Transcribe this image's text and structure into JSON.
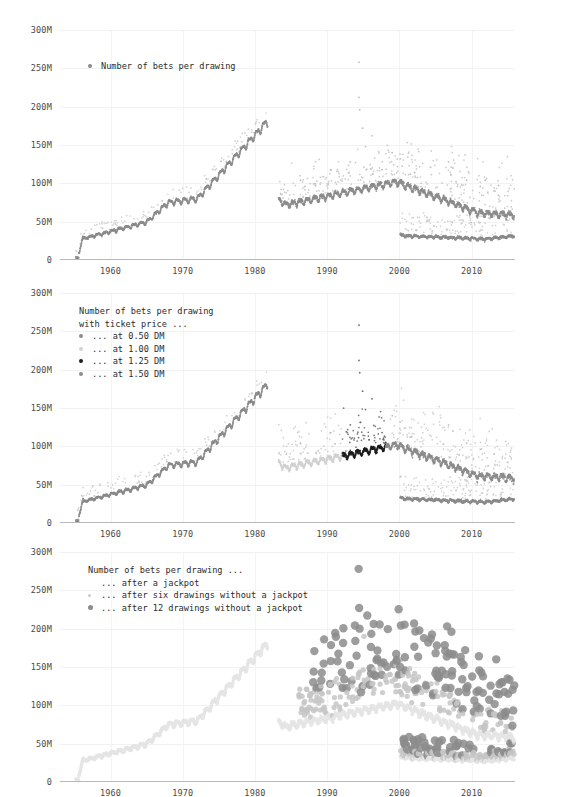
{
  "figure": {
    "background": "#ffffff",
    "gridline_color": "#f2f2f2",
    "axis_color": "#b9b9b9",
    "text_color": "#3a3a3a"
  },
  "colors": {
    "mid_gray": "#8c8c8c",
    "light_gray": "#c9c9c9",
    "very_light_gray": "#e2e2e2",
    "dark": "#222222",
    "outlier_gray": "#bdbdbd"
  },
  "charts": [
    {
      "id": "chart-total-bets",
      "type": "scatter",
      "title": "",
      "xlabel": "",
      "ylabel": "",
      "xlim": [
        1953,
        2016
      ],
      "ylim": [
        0,
        300
      ],
      "grid": true,
      "legend_position": "top-left",
      "ytick_labels": [
        "300M",
        "250M",
        "200M",
        "150M",
        "100M",
        "50M",
        "0"
      ],
      "ytick_values": [
        300,
        250,
        200,
        150,
        100,
        50,
        0
      ],
      "xtick_labels": [
        "1960",
        "1970",
        "1980",
        "1990",
        "2000",
        "2010"
      ],
      "xtick_values": [
        1960,
        1970,
        1980,
        1990,
        2000,
        2010
      ],
      "legend": [
        {
          "label": "Number of bets per drawing",
          "color": "#8c8c8c",
          "marker": "circle"
        }
      ],
      "series": [
        {
          "name": "Number of bets per drawing",
          "color": "#8c8c8c",
          "note": "weekly draws 1955-2015; rises to 180M by 1981, gap 1982-83, plateau ~100M 1985-2000, decline to ~60M by 2015; second lower branch ~30M from 2000 (midweek draw)"
        }
      ]
    },
    {
      "id": "chart-ticket-price",
      "type": "scatter",
      "title": "",
      "xlabel": "",
      "ylabel": "",
      "xlim": [
        1953,
        2016
      ],
      "ylim": [
        0,
        300
      ],
      "grid": true,
      "legend_position": "top-left",
      "ytick_labels": [
        "300M",
        "250M",
        "200M",
        "150M",
        "100M",
        "50M",
        "0"
      ],
      "ytick_values": [
        300,
        250,
        200,
        150,
        100,
        50,
        0
      ],
      "xtick_labels": [
        "1960",
        "1970",
        "1980",
        "1990",
        "2000",
        "2010"
      ],
      "xtick_values": [
        1960,
        1970,
        1980,
        1990,
        2000,
        2010
      ],
      "legend_title_lines": [
        "Number of bets per drawing",
        "with ticket price ..."
      ],
      "legend": [
        {
          "label": "... at 0.50 DM",
          "color": "#8c8c8c",
          "marker": "circle"
        },
        {
          "label": "... at 1.00 DM",
          "color": "#d2d2d2",
          "marker": "circle"
        },
        {
          "label": "... at 1.25 DM",
          "color": "#1d1d1d",
          "marker": "circle"
        },
        {
          "label": "... at 1.50 DM",
          "color": "#8c8c8c",
          "marker": "circle"
        }
      ],
      "series": [
        {
          "name": "... at 0.50 DM",
          "color": "#8c8c8c",
          "span": [
            1955,
            1981
          ]
        },
        {
          "name": "... at 1.00 DM",
          "color": "#d2d2d2",
          "span": [
            1983,
            1992
          ]
        },
        {
          "name": "... at 1.25 DM",
          "color": "#1d1d1d",
          "span": [
            1992,
            1998
          ]
        },
        {
          "name": "... at 1.50 DM",
          "color": "#8c8c8c",
          "span": [
            1998,
            2015
          ]
        }
      ]
    },
    {
      "id": "chart-jackpot-rollover",
      "type": "scatter",
      "title": "",
      "xlabel": "",
      "ylabel": "",
      "xlim": [
        1953,
        2016
      ],
      "ylim": [
        0,
        300
      ],
      "grid": true,
      "legend_position": "top-left",
      "ytick_labels": [
        "300M",
        "250M",
        "200M",
        "150M",
        "100M",
        "50M",
        "0"
      ],
      "ytick_values": [
        300,
        250,
        200,
        150,
        100,
        50,
        0
      ],
      "xtick_labels": [
        "1960",
        "1970",
        "1980",
        "1990",
        "2000",
        "2010"
      ],
      "xtick_values": [
        1960,
        1970,
        1980,
        1990,
        2000,
        2010
      ],
      "legend_title_lines": [
        "Number of bets per drawing ..."
      ],
      "legend": [
        {
          "label": "... after a jackpot",
          "color": "#e8e8e8",
          "marker": "none",
          "size": 0
        },
        {
          "label": "... after six drawings without a jackpot",
          "color": "#c9c9c9",
          "marker": "circle",
          "size": 3
        },
        {
          "label": "... after 12 drawings without a jackpot",
          "color": "#8c8c8c",
          "marker": "circle",
          "size": 5
        }
      ],
      "series": [
        {
          "name": "... after a jackpot",
          "color": "#e6e6e6",
          "size": 1.6
        },
        {
          "name": "... after six drawings without a jackpot",
          "color": "#c6c6c6",
          "size": 2.6
        },
        {
          "name": "... after 12 drawings without a jackpot",
          "color": "#8c8c8c",
          "size": 4.2
        }
      ]
    }
  ]
}
